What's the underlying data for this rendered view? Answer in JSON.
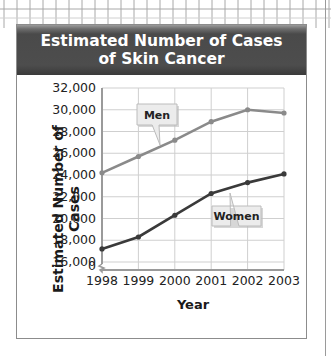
{
  "title_line1": "Estimated Number of Cases",
  "title_line2": "of Skin Cancer",
  "y_axis_label": "Estimated Number of Cases",
  "x_axis_label": "Year",
  "y_ticks": [
    "32,000",
    "30,000",
    "28,000",
    "26,000",
    "24,000",
    "22,000",
    "20,000",
    "18,000",
    "16,000",
    "0"
  ],
  "x_ticks": [
    "1998",
    "1999",
    "2000",
    "2001",
    "2002",
    "2003"
  ],
  "callouts": {
    "men": "Men",
    "women": "Women"
  },
  "colors": {
    "men_line": "#8a8a8a",
    "women_line": "#3a3a3a",
    "header_bg": "#4a4a4a",
    "grid": "#cfcfcf"
  },
  "chart_data": {
    "type": "line",
    "title": "Estimated Number of Cases of Skin Cancer",
    "xlabel": "Year",
    "ylabel": "Estimated Number of Cases",
    "categories": [
      "1998",
      "1999",
      "2000",
      "2001",
      "2002",
      "2003"
    ],
    "series": [
      {
        "name": "Men",
        "values": [
          24200,
          25700,
          27200,
          28900,
          30000,
          29700
        ]
      },
      {
        "name": "Women",
        "values": [
          17200,
          18300,
          20300,
          22300,
          23300,
          24100
        ]
      }
    ],
    "ylim": [
      0,
      32000
    ],
    "y_axis_break": [
      0,
      16000
    ],
    "grid": true,
    "legend": "callout labels on lines"
  }
}
